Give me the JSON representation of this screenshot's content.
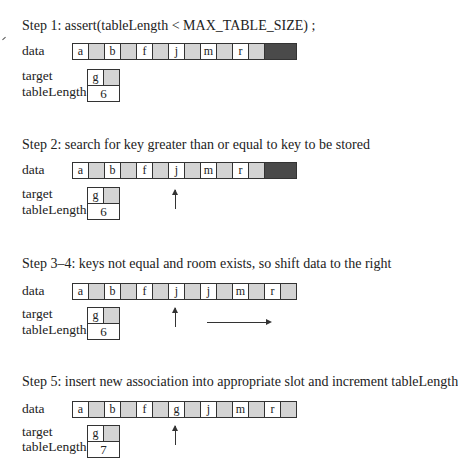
{
  "labels": {
    "data": "data",
    "target": "target",
    "tableLength": "tableLength"
  },
  "steps": [
    {
      "title": "Step 1: assert(tableLength < MAX_TABLE_SIZE) ;",
      "data": [
        {
          "key": "a"
        },
        {
          "key": "",
          "gray": true
        },
        {
          "key": "b"
        },
        {
          "key": "",
          "gray": true
        },
        {
          "key": "f"
        },
        {
          "key": "",
          "gray": true
        },
        {
          "key": "j"
        },
        {
          "key": "",
          "gray": true
        },
        {
          "key": "m"
        },
        {
          "key": "",
          "gray": true
        },
        {
          "key": "r"
        },
        {
          "key": "",
          "gray": true
        },
        {
          "key": "",
          "dark": true
        }
      ],
      "target": "g",
      "tableLength": "6"
    },
    {
      "title": "Step 2: search for key greater than or equal to key to be stored",
      "data": [
        {
          "key": "a"
        },
        {
          "key": "",
          "gray": true
        },
        {
          "key": "b"
        },
        {
          "key": "",
          "gray": true
        },
        {
          "key": "f"
        },
        {
          "key": "",
          "gray": true
        },
        {
          "key": "j"
        },
        {
          "key": "",
          "gray": true
        },
        {
          "key": "m"
        },
        {
          "key": "",
          "gray": true
        },
        {
          "key": "r"
        },
        {
          "key": "",
          "gray": true
        },
        {
          "key": "",
          "dark": true
        }
      ],
      "target": "g",
      "tableLength": "6",
      "pointer_index": 6
    },
    {
      "title": "Step 3–4: keys not equal and room exists, so shift data to the right",
      "data": [
        {
          "key": "a"
        },
        {
          "key": "",
          "gray": true
        },
        {
          "key": "b"
        },
        {
          "key": "",
          "gray": true
        },
        {
          "key": "f"
        },
        {
          "key": "",
          "gray": true
        },
        {
          "key": "j"
        },
        {
          "key": "",
          "gray": true
        },
        {
          "key": "j"
        },
        {
          "key": "",
          "gray": true
        },
        {
          "key": "m"
        },
        {
          "key": "",
          "gray": true
        },
        {
          "key": "r"
        },
        {
          "key": "",
          "gray": true
        }
      ],
      "target": "g",
      "tableLength": "6",
      "pointer_index": 6,
      "shift_arrow": true
    },
    {
      "title": "Step 5: insert new association into appropriate slot and increment tableLength",
      "data": [
        {
          "key": "a"
        },
        {
          "key": "",
          "gray": true
        },
        {
          "key": "b"
        },
        {
          "key": "",
          "gray": true
        },
        {
          "key": "f"
        },
        {
          "key": "",
          "gray": true
        },
        {
          "key": "g"
        },
        {
          "key": "",
          "gray": true
        },
        {
          "key": "j"
        },
        {
          "key": "",
          "gray": true
        },
        {
          "key": "m"
        },
        {
          "key": "",
          "gray": true
        },
        {
          "key": "r"
        },
        {
          "key": "",
          "gray": true
        }
      ],
      "target": "g",
      "tableLength": "7",
      "pointer_index": 6
    }
  ]
}
